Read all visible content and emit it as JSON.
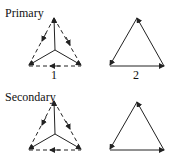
{
  "sections": [
    {
      "title": "Primary",
      "left_label": "1",
      "right_label": "2"
    },
    {
      "title": "Secondary",
      "left_label": "",
      "right_label": ""
    }
  ],
  "colors": {
    "line": "#222222",
    "background": "#ffffff"
  }
}
